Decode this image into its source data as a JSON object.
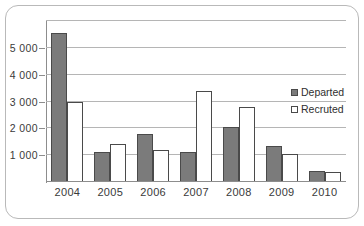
{
  "chart_data": {
    "type": "bar",
    "title": "",
    "xlabel": "",
    "ylabel": "",
    "categories": [
      "2004",
      "2005",
      "2006",
      "2007",
      "2008",
      "2009",
      "2010"
    ],
    "series": [
      {
        "name": "Departed",
        "values": [
          5550,
          1120,
          1800,
          1120,
          2050,
          1350,
          420
        ]
      },
      {
        "name": "Recruted",
        "values": [
          3000,
          1400,
          1200,
          3400,
          2800,
          1050,
          360
        ]
      }
    ],
    "ylim": [
      0,
      6000
    ],
    "ytick_labels": [
      "1 000",
      "2 000",
      "3 000",
      "4 000",
      "5 000"
    ],
    "ytick_values": [
      1000,
      2000,
      3000,
      4000,
      5000
    ],
    "gridlines": [
      1000,
      2000,
      3000,
      4000,
      5000,
      6000
    ],
    "grid": true,
    "legend_position": "right",
    "colors": {
      "departed_fill": "#7b7b7b",
      "recruted_fill": "#ffffff",
      "bar_outline": "#4a4a4a",
      "gridline": "#b5b5b5",
      "axis": "#8d8d8d",
      "frame": "#b9b9b9",
      "text": "#3a3a3a"
    }
  },
  "legend": {
    "items": [
      {
        "label": "Departed",
        "swatch": "filled-square-icon"
      },
      {
        "label": "Recruted",
        "swatch": "empty-square-icon"
      }
    ]
  }
}
